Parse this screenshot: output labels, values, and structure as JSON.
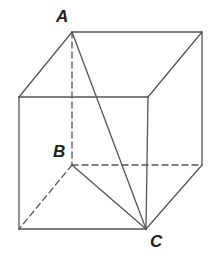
{
  "diagram": {
    "type": "cube",
    "stroke_color": "#555555",
    "label_color": "#222222",
    "vertices": {
      "A": {
        "x": 72,
        "y": 32
      },
      "TBR": {
        "x": 202,
        "y": 32
      },
      "TFL": {
        "x": 19,
        "y": 97
      },
      "TFR": {
        "x": 148,
        "y": 97
      },
      "B": {
        "x": 72,
        "y": 165
      },
      "BBR": {
        "x": 202,
        "y": 165
      },
      "BFL": {
        "x": 19,
        "y": 229
      },
      "C": {
        "x": 146,
        "y": 229
      }
    },
    "labels": [
      {
        "id": "A",
        "text": "A",
        "x": 56,
        "y": 8
      },
      {
        "id": "B",
        "text": "B",
        "x": 53,
        "y": 143
      },
      {
        "id": "C",
        "text": "C",
        "x": 150,
        "y": 233
      }
    ],
    "visible_edges": [
      [
        "A",
        "TBR"
      ],
      [
        "A",
        "TFL"
      ],
      [
        "TBR",
        "TFR"
      ],
      [
        "TFL",
        "TFR"
      ],
      [
        "TFL",
        "BFL"
      ],
      [
        "TFR",
        "C"
      ],
      [
        "TBR",
        "BBR"
      ],
      [
        "BFL",
        "C"
      ],
      [
        "BBR",
        "C"
      ]
    ],
    "hidden_edges": [
      [
        "A",
        "B"
      ],
      [
        "B",
        "BBR"
      ],
      [
        "B",
        "BFL"
      ]
    ],
    "diagonals": [
      [
        "A",
        "C"
      ],
      [
        "B",
        "C"
      ]
    ]
  }
}
